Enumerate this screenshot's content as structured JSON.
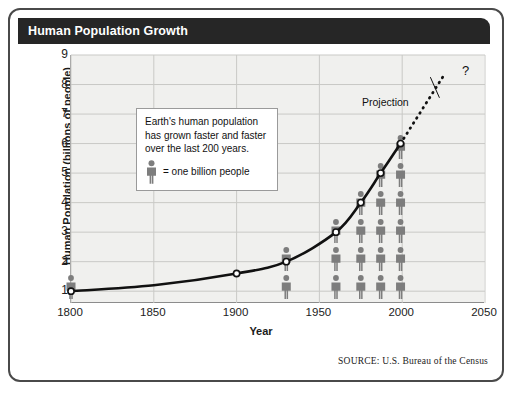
{
  "header": {
    "title": "Human Population Growth"
  },
  "source_note": "SOURCE: U.S. Bureau of the Census",
  "callout": {
    "line1": "Earth's human population",
    "line2": "has  grown faster and faster",
    "line3": "over the last 200 years.",
    "legend_text": "= one billion people",
    "legend_icon": "person-icon"
  },
  "annotations": {
    "projection_label": "Projection",
    "question_mark": "?"
  },
  "colors": {
    "title_bar": "#262626",
    "plot_background": "#f0f0ee",
    "gridline": "#c9c9c6",
    "curve": "#111111",
    "person": "#7d7d7d",
    "frame_border": "#4a4a4a"
  },
  "chart_data": {
    "type": "line",
    "title": "Human Population Growth",
    "xlabel": "Year",
    "ylabel": "Human Population (billions of people)",
    "xlim": [
      1800,
      2050
    ],
    "ylim": [
      0.6,
      9
    ],
    "grid": true,
    "legend_position": "inset-callout",
    "xticks": [
      1800,
      1850,
      1900,
      1950,
      2000,
      2050
    ],
    "yticks": [
      1,
      2,
      3,
      4,
      5,
      6,
      7,
      8,
      9
    ],
    "series": [
      {
        "name": "Observed population",
        "style": "solid",
        "markers": true,
        "x": [
          1800,
          1850,
          1900,
          1930,
          1960,
          1975,
          1987,
          1999
        ],
        "y": [
          1.0,
          1.2,
          1.6,
          2.0,
          3.0,
          4.0,
          5.0,
          6.0
        ]
      },
      {
        "name": "Projection",
        "style": "dotted",
        "markers": false,
        "x": [
          1999,
          2025
        ],
        "y": [
          6.0,
          8.3
        ]
      }
    ],
    "pictograms": {
      "unit_value": 1,
      "unit_label": "one billion people",
      "columns": [
        {
          "year": 1800,
          "count": 1
        },
        {
          "year": 1930,
          "count": 2
        },
        {
          "year": 1960,
          "count": 3
        },
        {
          "year": 1975,
          "count": 4
        },
        {
          "year": 1987,
          "count": 5
        },
        {
          "year": 1999,
          "count": 6
        }
      ]
    },
    "annotations": [
      {
        "text": "Projection",
        "x": 2018,
        "y": 8.4
      },
      {
        "text": "?",
        "x": 2026,
        "y": 8.55
      }
    ]
  }
}
